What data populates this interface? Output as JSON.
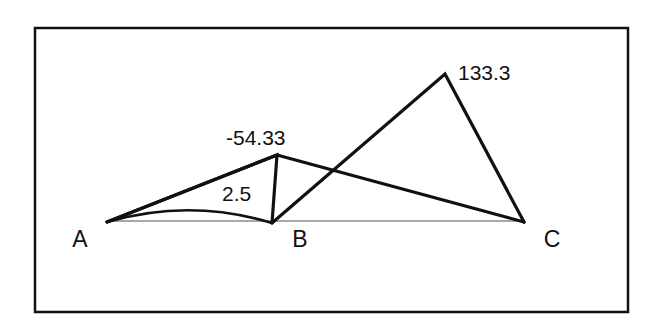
{
  "figure": {
    "background_color": "#ffffff",
    "stroke_color": "#111111",
    "baseline_color": "#555555",
    "border": {
      "name": "figure-border",
      "x": 35,
      "y": 28,
      "width": 593,
      "height": 284,
      "stroke_width": 2.5
    },
    "vertices": [
      {
        "id": "A",
        "label": "A",
        "x": 107,
        "y": 222,
        "label_x": 80,
        "label_y": 247
      },
      {
        "id": "B",
        "label": "B",
        "x": 272,
        "y": 223,
        "label_x": 300,
        "label_y": 247
      },
      {
        "id": "C",
        "label": "C",
        "x": 524,
        "y": 222,
        "label_x": 552,
        "label_y": 247
      }
    ],
    "apexes": [
      {
        "id": "small-peak",
        "x": 277,
        "y": 155
      },
      {
        "id": "large-apex",
        "x": 445,
        "y": 74
      }
    ],
    "crossing_point": {
      "x": 330,
      "y": 172
    },
    "value_labels": [
      {
        "id": "large-triangle-value",
        "text": "133.3",
        "x": 458,
        "y": 80
      },
      {
        "id": "small-triangle-value",
        "text": "-54.33",
        "x": 226,
        "y": 145
      },
      {
        "id": "arc-region-value",
        "text": "2.5",
        "x": 222,
        "y": 201
      }
    ],
    "segments": [
      {
        "id": "baseline-A-to-C",
        "from": "A",
        "to": "C",
        "style": "thin",
        "stroke_width": 1.2
      },
      {
        "id": "edge-A-to-small-peak",
        "from": "A",
        "to": "small-peak",
        "style": "thick",
        "stroke_width": 3.2
      },
      {
        "id": "edge-small-peak-to-B",
        "from": "small-peak",
        "to": "B",
        "style": "thick",
        "stroke_width": 3.2
      },
      {
        "id": "edge-A-to-C-upper",
        "from": "A",
        "to": "C",
        "style": "thick",
        "stroke_width": 3.2
      },
      {
        "id": "edge-B-to-large-apex",
        "from": "B",
        "to": "large-apex",
        "style": "thick",
        "stroke_width": 3.2
      },
      {
        "id": "edge-large-apex-to-C",
        "from": "large-apex",
        "to": "C",
        "style": "thick",
        "stroke_width": 3.2
      }
    ],
    "arc": {
      "id": "arc-A-to-B",
      "from": "A",
      "to": "B",
      "control_x": 190,
      "control_y": 198,
      "stroke_width": 2.6
    }
  }
}
